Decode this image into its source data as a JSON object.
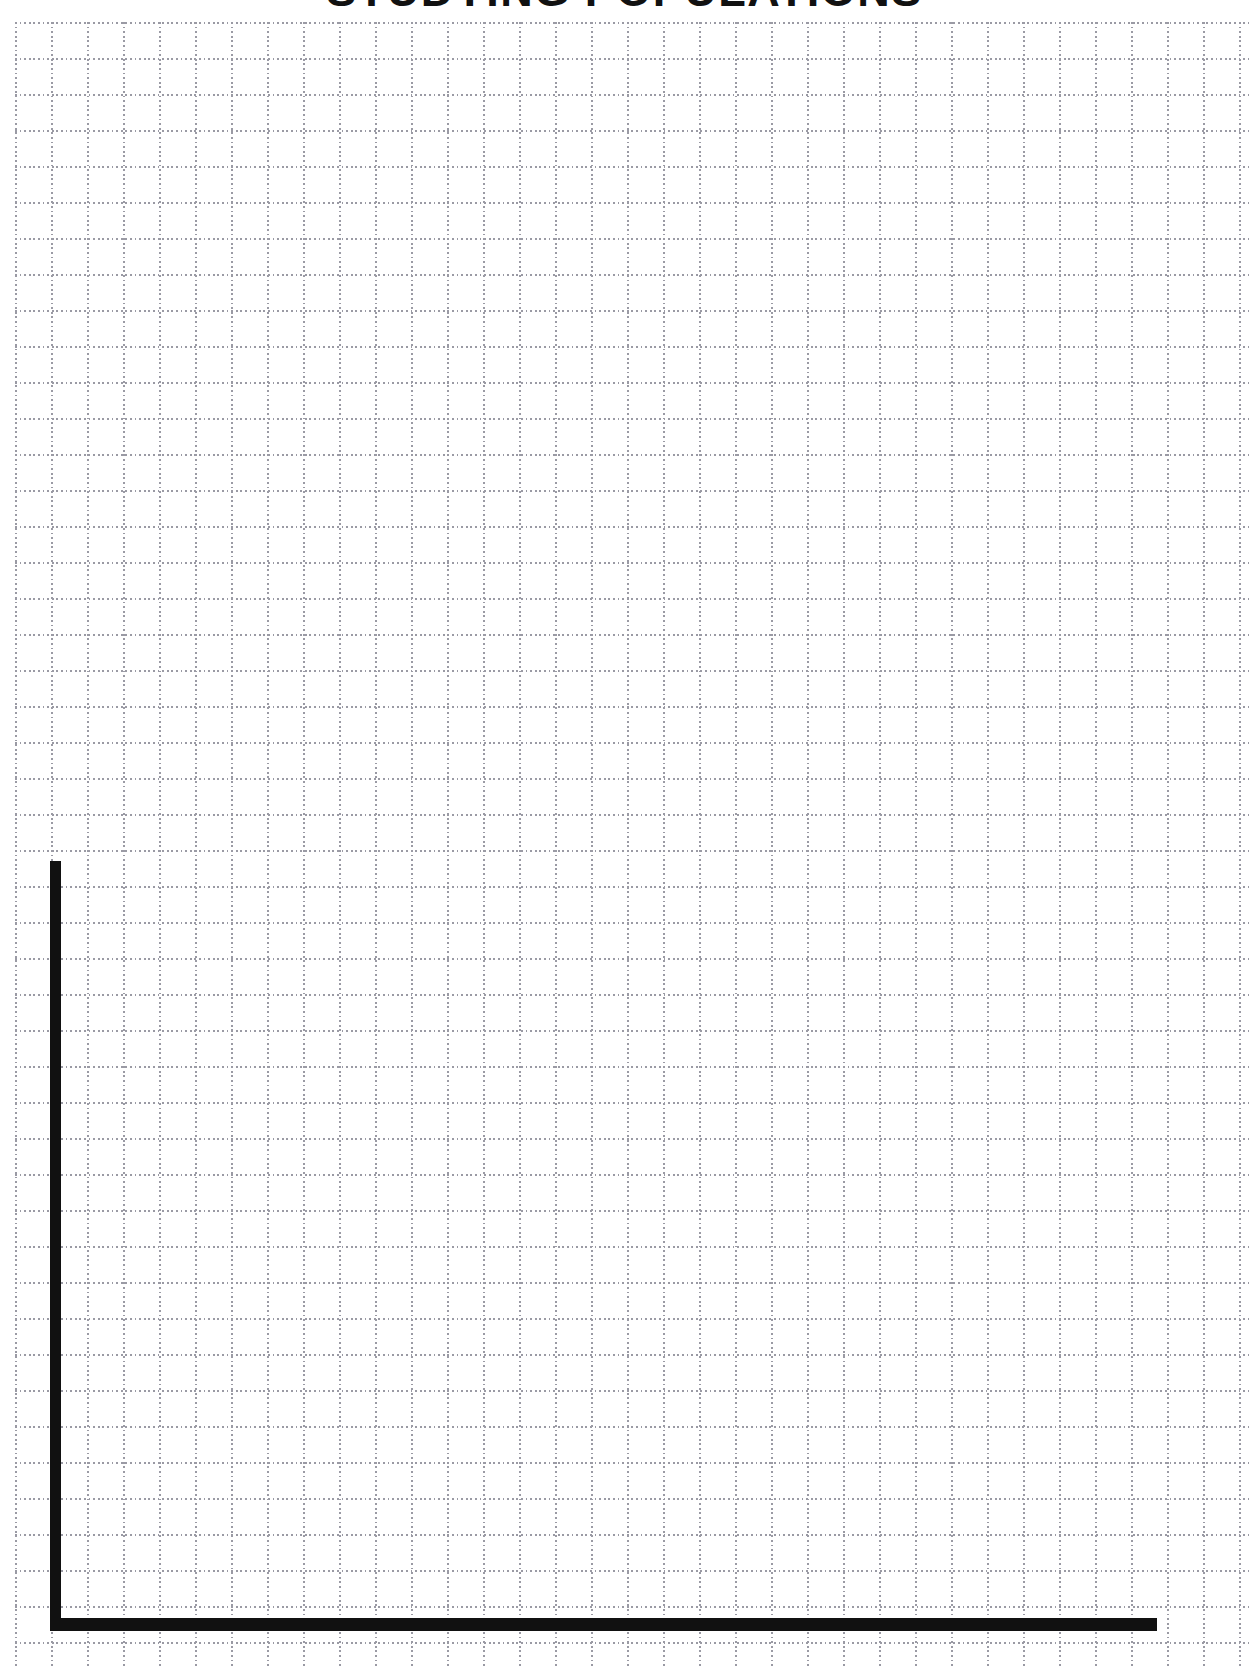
{
  "page": {
    "title": "STUDYING POPULATIONS",
    "background_color": "#ffffff",
    "width": 1249,
    "height": 1673
  },
  "worksheet": {
    "heading": "STUDYING POPULATIONS",
    "heading_color": "#111111"
  },
  "grid": {
    "style": "dotted",
    "line_color": "#9a9aa4",
    "spacing_px": 36,
    "columns": 34,
    "rows": 45
  },
  "chart_data": {
    "type": "line",
    "title": "STUDYING POPULATIONS",
    "subtitle": "",
    "xlabel": "",
    "ylabel": "",
    "x": [],
    "values": [],
    "series": [],
    "categories": [],
    "xlim": [
      0,
      0
    ],
    "ylim": [
      0,
      0
    ],
    "grid": true,
    "grid_style": "dotted",
    "legend": "none",
    "annotations": [],
    "note": "Blank graph worksheet: empty plotting area with drawn x and y axes and no plotted data, tick labels, or legend."
  },
  "axes": {
    "line_color": "#111111",
    "y_axis": {
      "orientation": "vertical",
      "thickness_px": 11,
      "label": ""
    },
    "x_axis": {
      "orientation": "horizontal",
      "thickness_px": 13,
      "label": ""
    },
    "tick_labels_x": [],
    "tick_labels_y": []
  }
}
